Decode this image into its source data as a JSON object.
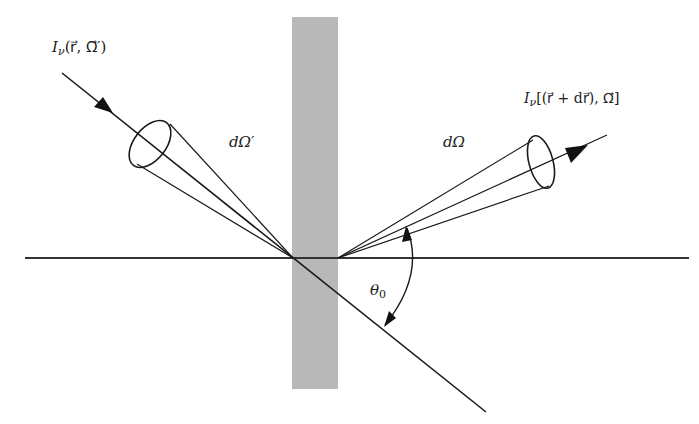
{
  "diagram": {
    "type": "radiative transfer geometry through a slab",
    "labels": {
      "incident_intensity": "I",
      "incident_intensity_sub": "ν",
      "incident_intensity_args": "(r⃗, Ω⃗′)",
      "outgoing_intensity": "I",
      "outgoing_intensity_sub": "ν",
      "outgoing_intensity_args": "[(r⃗ + dr⃗), Ω⃗]",
      "incident_solid_angle": "dΩ′",
      "outgoing_solid_angle": "dΩ",
      "angle": "θ",
      "angle_sub": "0"
    },
    "colors": {
      "line": "#1a1a1a",
      "slab": "#b8b8b8",
      "background": "#ffffff"
    }
  }
}
